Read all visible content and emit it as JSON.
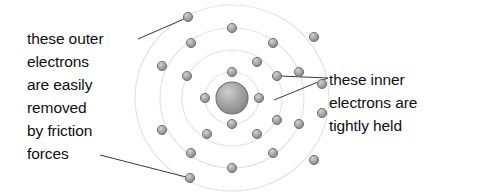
{
  "diagram": {
    "nucleus": {
      "cx": 232,
      "cy": 98,
      "r": 16,
      "fill": "#9a9a9a",
      "stroke": "#6f6f6f"
    },
    "shell_color": "#e2e2e2",
    "electron_fill": "#a8a8a8",
    "electron_stroke": "#6b6b6b",
    "electron_radius": 4.6,
    "leader_color": "#3a3a3a",
    "shells": [
      {
        "name": "shell-1",
        "rx": 27,
        "ry": 26,
        "electron_count": 4
      },
      {
        "name": "shell-2",
        "rx": 50,
        "ry": 48,
        "electron_count": 6
      },
      {
        "name": "shell-3",
        "rx": 72,
        "ry": 70,
        "electron_count": 8
      },
      {
        "name": "shell-4",
        "rx": 97,
        "ry": 93,
        "electron_count": 8
      }
    ],
    "electrons": [
      {
        "name": "electron-s1-n",
        "cx": 232,
        "cy": 72
      },
      {
        "name": "electron-s1-e",
        "cx": 259,
        "cy": 98
      },
      {
        "name": "electron-s1-s",
        "cx": 232,
        "cy": 124
      },
      {
        "name": "electron-s1-w",
        "cx": 205,
        "cy": 98
      },
      {
        "name": "electron-s2-nne",
        "cx": 257,
        "cy": 62
      },
      {
        "name": "electron-s2-ene",
        "cx": 277,
        "cy": 76
      },
      {
        "name": "electron-s2-ese",
        "cx": 277,
        "cy": 120
      },
      {
        "name": "electron-s2-sse",
        "cx": 257,
        "cy": 134
      },
      {
        "name": "electron-s2-ssw",
        "cx": 207,
        "cy": 134
      },
      {
        "name": "electron-s2-wnw",
        "cx": 187,
        "cy": 76
      },
      {
        "name": "electron-s3-n",
        "cx": 232,
        "cy": 28
      },
      {
        "name": "electron-s3-nne",
        "cx": 273,
        "cy": 43
      },
      {
        "name": "electron-s3-ene",
        "cx": 299,
        "cy": 72
      },
      {
        "name": "electron-s3-ese",
        "cx": 299,
        "cy": 124
      },
      {
        "name": "electron-s3-sse",
        "cx": 273,
        "cy": 153
      },
      {
        "name": "electron-s3-s",
        "cx": 232,
        "cy": 168
      },
      {
        "name": "electron-s3-wsw",
        "cx": 191,
        "cy": 153
      },
      {
        "name": "electron-s3-wnw",
        "cx": 191,
        "cy": 43
      },
      {
        "name": "electron-s4-nnw",
        "cx": 188,
        "cy": 17
      },
      {
        "name": "electron-s4-nne",
        "cx": 314,
        "cy": 37
      },
      {
        "name": "electron-s4-ene",
        "cx": 322,
        "cy": 84
      },
      {
        "name": "electron-s4-ese",
        "cx": 322,
        "cy": 113
      },
      {
        "name": "electron-s4-sse",
        "cx": 314,
        "cy": 160
      },
      {
        "name": "electron-s4-s",
        "cx": 190,
        "cy": 178
      },
      {
        "name": "electron-s4-wsw",
        "cx": 162,
        "cy": 130
      },
      {
        "name": "electron-s4-wnw",
        "cx": 162,
        "cy": 66
      }
    ],
    "leaders": [
      {
        "name": "leader-outer-top",
        "x1": 138,
        "y1": 39,
        "x2": 184,
        "y2": 19
      },
      {
        "name": "leader-outer-bottom",
        "x1": 100,
        "y1": 155,
        "x2": 186,
        "y2": 177
      },
      {
        "name": "leader-inner-upper",
        "x1": 328,
        "y1": 78,
        "x2": 280,
        "y2": 76
      },
      {
        "name": "leader-inner-lower",
        "x1": 328,
        "y1": 78,
        "x2": 274,
        "y2": 100
      }
    ]
  },
  "callout_left": {
    "name": "outer-electrons-label",
    "lines": [
      "these outer",
      "electrons",
      "are easily",
      "removed",
      "by friction",
      "forces"
    ]
  },
  "callout_right": {
    "name": "inner-electrons-label",
    "lines": [
      "these inner",
      "electrons are",
      "tightly held"
    ]
  }
}
